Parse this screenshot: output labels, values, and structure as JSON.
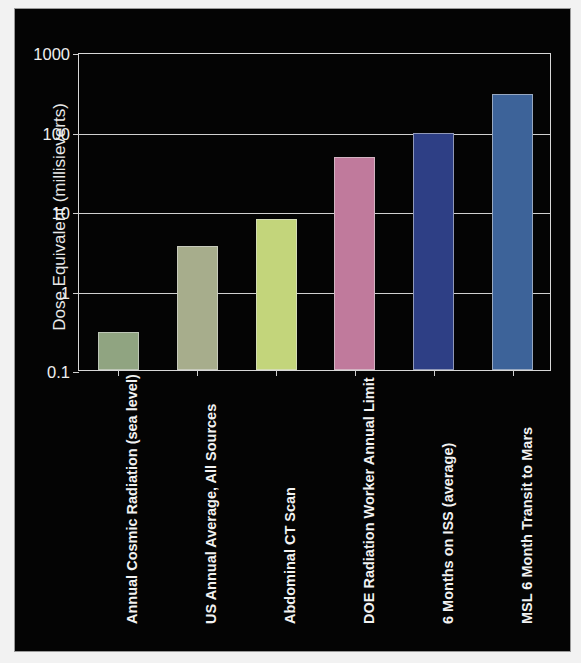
{
  "chart_data": {
    "type": "bar",
    "title": "",
    "subtitle": "",
    "xlabel": "",
    "ylabel": "Dose Equivalent (millisieverts)",
    "yscale": "log",
    "ylim": [
      0.1,
      1000
    ],
    "ytick_labels": [
      "1000",
      "100",
      "10",
      "1",
      "0.1"
    ],
    "ytick_values": [
      1000,
      100,
      10,
      1,
      0.1
    ],
    "grid": true,
    "legend": "none",
    "background_color": "#040404",
    "axis_color": "#d0d0d0",
    "text_color": "#f2f2f2",
    "categories": [
      "Annual Cosmic Radiation (sea level)",
      "US Annual Average, All Sources",
      "Abdominal CT Scan",
      "DOE Radiation Worker Annual Limit",
      "6 Months on ISS (average)",
      "MSL  6 Month Transit to Mars"
    ],
    "values": [
      0.3,
      3.6,
      8,
      48,
      95,
      300
    ],
    "bar_colors": [
      "#90a481",
      "#a7ad8c",
      "#c3d57b",
      "#c07a9c",
      "#2e3f85",
      "#3d6399"
    ]
  }
}
